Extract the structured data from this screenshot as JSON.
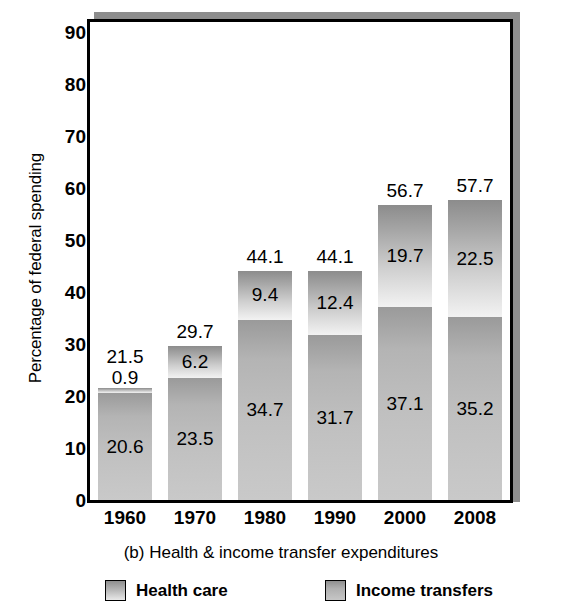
{
  "chart_data": {
    "type": "bar",
    "subtype": "stacked-bar",
    "title": "",
    "caption": "(b) Health & income transfer expenditures",
    "xlabel": "",
    "ylabel": "Percentage of federal spending",
    "categories": [
      "1960",
      "1970",
      "1980",
      "1990",
      "2000",
      "2008"
    ],
    "ylim": [
      0,
      92
    ],
    "yticks": [
      "0",
      "10",
      "20",
      "30",
      "40",
      "50",
      "60",
      "70",
      "80",
      "90"
    ],
    "ytick_values": [
      0,
      10,
      20,
      30,
      40,
      50,
      60,
      70,
      80,
      90
    ],
    "grid": false,
    "legend_position": "bottom",
    "series": [
      {
        "name": "Income transfers",
        "stack_position": "bottom",
        "values": [
          20.6,
          23.5,
          34.7,
          31.7,
          37.1,
          35.2
        ],
        "labels": [
          "20.6",
          "23.5",
          "34.7",
          "31.7",
          "37.1",
          "35.2"
        ],
        "color": "#bdbdbd"
      },
      {
        "name": "Health care",
        "stack_position": "top",
        "values": [
          0.9,
          6.2,
          9.4,
          12.4,
          19.7,
          22.5
        ],
        "labels": [
          "0.9",
          "6.2",
          "9.4",
          "12.4",
          "19.7",
          "22.5"
        ],
        "color": "#c9c9c9"
      }
    ],
    "totals": [
      21.5,
      29.7,
      44.1,
      44.1,
      56.7,
      57.7
    ],
    "total_labels": [
      "21.5",
      "29.7",
      "44.1",
      "44.1",
      "56.7",
      "57.7"
    ]
  },
  "legend": {
    "items": [
      {
        "label": "Health care"
      },
      {
        "label": "Income transfers"
      }
    ]
  },
  "colors": {
    "frame": "#000000",
    "shadow": "#8d8d8d",
    "background": "#ffffff",
    "text": "#000000"
  }
}
